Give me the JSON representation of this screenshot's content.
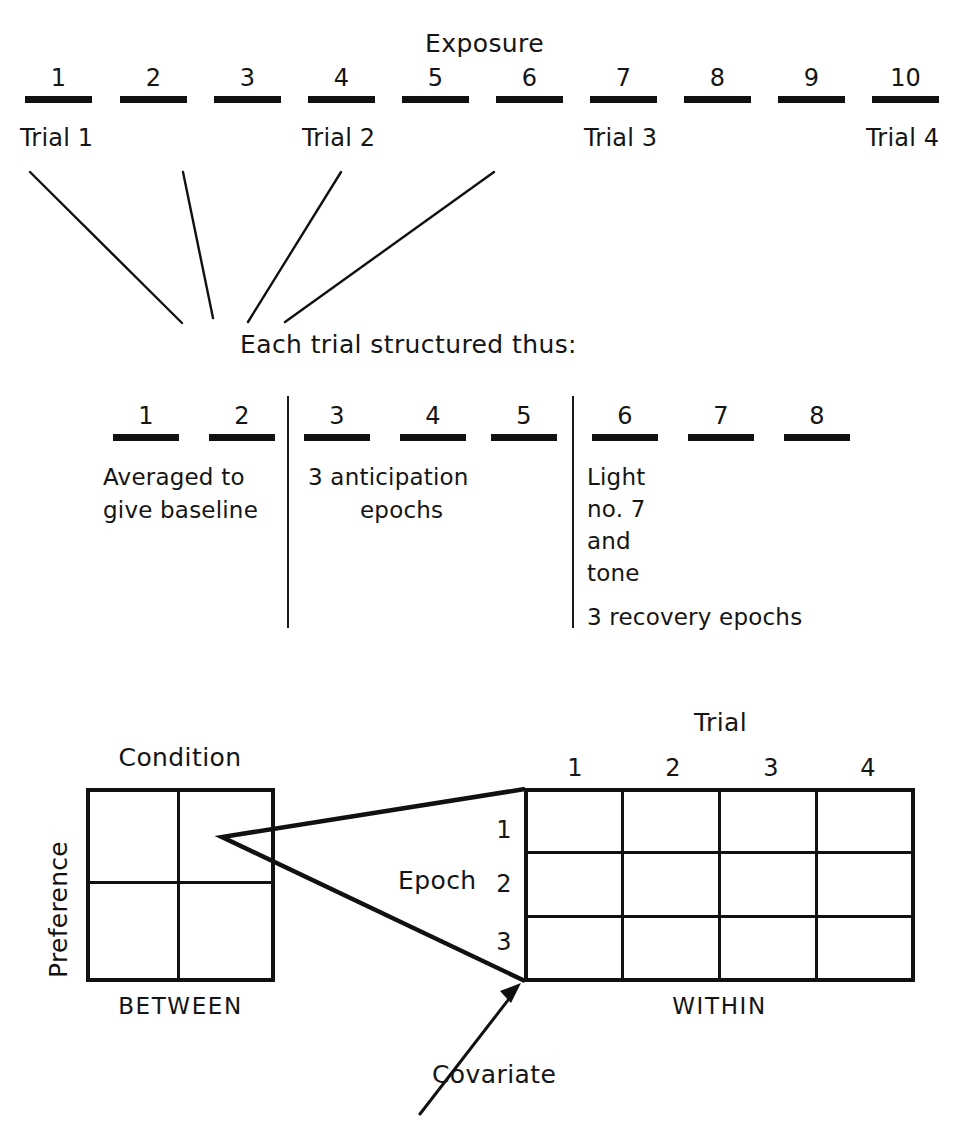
{
  "figure": {
    "type": "diagram"
  },
  "exposure_section": {
    "title": "Exposure",
    "epoch_numbers": [
      "1",
      "2",
      "3",
      "4",
      "5",
      "6",
      "7",
      "8",
      "9",
      "10"
    ],
    "trial_labels": [
      {
        "text": "Trial 1",
        "starts_at_epoch": 1
      },
      {
        "text": "Trial 2",
        "starts_at_epoch": 4
      },
      {
        "text": "Trial 3",
        "starts_at_epoch": 7
      },
      {
        "text": "Trial 4",
        "starts_at_epoch": 10
      }
    ]
  },
  "trial_structure": {
    "caption": "Each trial structured thus:",
    "epoch_numbers": [
      "1",
      "2",
      "3",
      "4",
      "5",
      "6",
      "7",
      "8"
    ],
    "groups": [
      {
        "name": "baseline",
        "epochs": [
          "1",
          "2"
        ],
        "lines": [
          "Averaged to",
          "give baseline"
        ]
      },
      {
        "name": "anticipation",
        "epochs": [
          "3",
          "4",
          "5"
        ],
        "lines": [
          "3 anticipation",
          "epochs"
        ]
      },
      {
        "name": "stimulus-and-recovery",
        "epochs": [
          "6",
          "7",
          "8"
        ],
        "lines": [
          "Light",
          "no. 7",
          "and",
          "tone"
        ],
        "extra_line": "3 recovery epochs"
      }
    ]
  },
  "design_section": {
    "between": {
      "column_factor": "Condition",
      "row_factor": "Preference",
      "caption": "BETWEEN",
      "rows": 2,
      "cols": 2
    },
    "within": {
      "column_factor": "Trial",
      "column_labels": [
        "1",
        "2",
        "3",
        "4"
      ],
      "row_factor": "Epoch",
      "row_labels": [
        "1",
        "2",
        "3"
      ],
      "caption": "WITHIN",
      "rows": 3,
      "cols": 4
    },
    "covariate_label": "Covariate"
  },
  "colors": {
    "ink": "#111111",
    "background": "#ffffff"
  }
}
